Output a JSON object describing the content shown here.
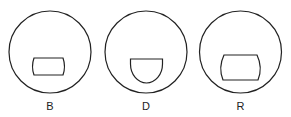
{
  "figures": [
    {
      "label": "B",
      "shape": "rounded-rectangle"
    },
    {
      "label": "D",
      "shape": "semicircle"
    },
    {
      "label": "R",
      "shape": "barrel"
    }
  ],
  "colors": {
    "stroke": "#222222",
    "background": "#ffffff"
  }
}
